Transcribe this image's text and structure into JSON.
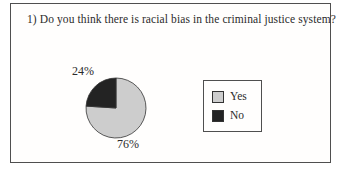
{
  "chart_data": {
    "type": "pie",
    "title": "1) Do you think there is racial bias in the criminal justice system?",
    "slices": [
      {
        "label": "Yes",
        "value": 76,
        "display": "76%",
        "color": "#cdcdcd"
      },
      {
        "label": "No",
        "value": 24,
        "display": "24%",
        "color": "#232323"
      }
    ],
    "start_angle": "top",
    "direction": "clockwise",
    "legend_position": "right",
    "legend_entries": [
      "Yes",
      "No"
    ],
    "outline_color": "#333333",
    "frame_border_color": "#4f4f4f",
    "text_color": "#2b2b2b"
  }
}
